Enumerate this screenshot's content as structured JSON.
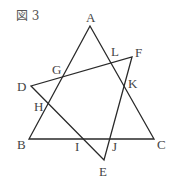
{
  "figure": {
    "title": "図 3",
    "line_color": "#2a2a2a",
    "label_color": "#444444",
    "background": "#ffffff"
  },
  "triangles": [
    {
      "name": "ABC",
      "vertices": [
        "A",
        "B",
        "C"
      ]
    },
    {
      "name": "DEF",
      "vertices": [
        "D",
        "E",
        "F"
      ]
    }
  ],
  "points": {
    "A": {
      "label": "A",
      "x": 90,
      "y": 26
    },
    "B": {
      "label": "B",
      "x": 29,
      "y": 139
    },
    "C": {
      "label": "C",
      "x": 154,
      "y": 139
    },
    "D": {
      "label": "D",
      "x": 31,
      "y": 86
    },
    "E": {
      "label": "E",
      "x": 104,
      "y": 160
    },
    "F": {
      "label": "F",
      "x": 132,
      "y": 57
    },
    "G": {
      "label": "G"
    },
    "H": {
      "label": "H"
    },
    "I": {
      "label": "I"
    },
    "J": {
      "label": "J"
    },
    "K": {
      "label": "K"
    },
    "L": {
      "label": "L"
    }
  },
  "intersections": [
    {
      "label": "G",
      "of": [
        "AB",
        "DF"
      ]
    },
    {
      "label": "H",
      "of": [
        "AB",
        "DE"
      ]
    },
    {
      "label": "I",
      "of": [
        "BC",
        "DE"
      ]
    },
    {
      "label": "J",
      "of": [
        "BC",
        "EF"
      ]
    },
    {
      "label": "K",
      "of": [
        "AC",
        "EF"
      ]
    },
    {
      "label": "L",
      "of": [
        "AC",
        "DF"
      ]
    }
  ]
}
